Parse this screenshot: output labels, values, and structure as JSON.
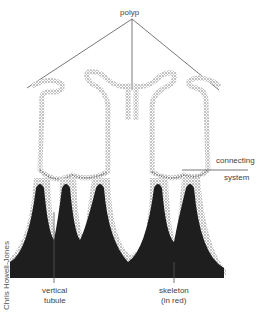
{
  "diagram": {
    "labels": {
      "polyp": "polyp",
      "connecting": "connecting",
      "system": "system",
      "vertical": "vertical",
      "tubule": "tubule",
      "skeleton": "skeleton",
      "in_red": "(in red)"
    },
    "credit": "Chris Howell-Jones",
    "colors": {
      "skeleton": "#1e1e1e",
      "tissue_stipple": "#8a8a8a",
      "leader_line": "#555555"
    }
  }
}
